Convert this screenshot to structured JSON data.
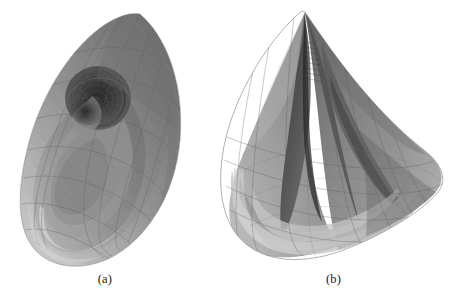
{
  "figure": {
    "background_color": "#ffffff",
    "render_style": "grayscale-transparent-wireframe-surface",
    "subfigures": [
      {
        "id": "a",
        "caption": "(a)",
        "shape_name": "almond-ovoid-vortex-surface",
        "description": "Tilted almond / ovoid self-intersecting surface with a dark circular vortex opening in the upper-left region",
        "silhouette_bbox": [
          20,
          12,
          182,
          266
        ],
        "vortex_center": [
          98,
          98
        ],
        "vortex_radius": 33
      },
      {
        "id": "b",
        "caption": "(b)",
        "shape_name": "conical-teardrop-pleat-surface",
        "description": "Cone / teardrop surface with a sharp apex at the top and a deep vertical pleated fold running down the middle",
        "silhouette_bbox": [
          222,
          12,
          446,
          268
        ],
        "apex": [
          305,
          12
        ]
      }
    ],
    "palette": {
      "darkest": "#2e2e2e",
      "dark": "#4a4a4a",
      "mid_dark": "#6b6b6b",
      "mid": "#8a8a8a",
      "mid_light": "#a0a0a0",
      "light": "#b8b8b8",
      "lightest": "#d2d2d2",
      "wireframe": "#5a5a5a",
      "caption_color": "#1a1a1a"
    }
  }
}
